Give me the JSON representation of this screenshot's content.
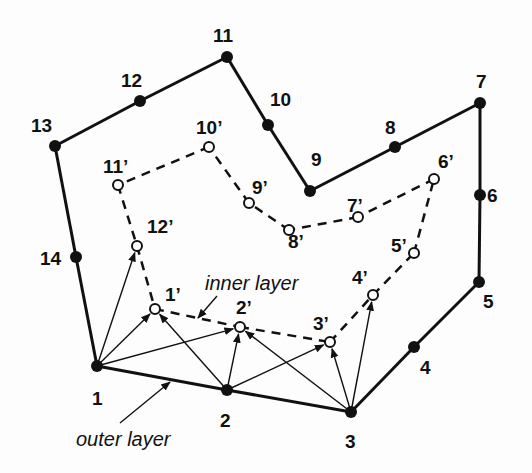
{
  "diagram": {
    "colors": {
      "ink": "#111111",
      "background": "#fdfdfd",
      "open_node_fill": "#ffffff"
    },
    "outer_layer": {
      "label": "outer layer",
      "style": "solid",
      "nodes": [
        {
          "id": "1",
          "label": "1",
          "x": 97,
          "y": 366,
          "lx": 92,
          "ly": 405
        },
        {
          "id": "2",
          "label": "2",
          "x": 227,
          "y": 390,
          "lx": 220,
          "ly": 427
        },
        {
          "id": "3",
          "label": "3",
          "x": 351,
          "y": 412,
          "lx": 345,
          "ly": 448
        },
        {
          "id": "4",
          "label": "4",
          "x": 414,
          "y": 347,
          "lx": 420,
          "ly": 374
        },
        {
          "id": "5",
          "label": "5",
          "x": 479,
          "y": 282,
          "lx": 483,
          "ly": 308
        },
        {
          "id": "6",
          "label": "6",
          "x": 480,
          "y": 195,
          "lx": 487,
          "ly": 202
        },
        {
          "id": "7",
          "label": "7",
          "x": 480,
          "y": 103,
          "lx": 476,
          "ly": 88
        },
        {
          "id": "8",
          "label": "8",
          "x": 395,
          "y": 147,
          "lx": 385,
          "ly": 134
        },
        {
          "id": "9",
          "label": "9",
          "x": 310,
          "y": 191,
          "lx": 311,
          "ly": 166
        },
        {
          "id": "10",
          "label": "10",
          "x": 268,
          "y": 125,
          "lx": 270,
          "ly": 106
        },
        {
          "id": "11",
          "label": "11",
          "x": 227,
          "y": 57,
          "lx": 213,
          "ly": 42
        },
        {
          "id": "12",
          "label": "12",
          "x": 140,
          "y": 101,
          "lx": 121,
          "ly": 87
        },
        {
          "id": "13",
          "label": "13",
          "x": 55,
          "y": 146,
          "lx": 31,
          "ly": 132
        },
        {
          "id": "14",
          "label": "14",
          "x": 76,
          "y": 257,
          "lx": 40,
          "ly": 265
        }
      ]
    },
    "inner_layer": {
      "label": "inner layer",
      "style": "dashed",
      "nodes": [
        {
          "id": "1p",
          "label": "1’",
          "x": 155,
          "y": 309,
          "lx": 165,
          "ly": 301
        },
        {
          "id": "2p",
          "label": "2’",
          "x": 240,
          "y": 327,
          "lx": 236,
          "ly": 314
        },
        {
          "id": "3p",
          "label": "3’",
          "x": 330,
          "y": 342,
          "lx": 313,
          "ly": 330
        },
        {
          "id": "4p",
          "label": "4’",
          "x": 373,
          "y": 295,
          "lx": 352,
          "ly": 284
        },
        {
          "id": "5p",
          "label": "5’",
          "x": 414,
          "y": 253,
          "lx": 391,
          "ly": 252
        },
        {
          "id": "6p",
          "label": "6’",
          "x": 434,
          "y": 179,
          "lx": 438,
          "ly": 168
        },
        {
          "id": "7p",
          "label": "7’",
          "x": 358,
          "y": 217,
          "lx": 347,
          "ly": 212
        },
        {
          "id": "8p",
          "label": "8’",
          "x": 289,
          "y": 230,
          "lx": 288,
          "ly": 248
        },
        {
          "id": "9p",
          "label": "9’",
          "x": 249,
          "y": 203,
          "lx": 252,
          "ly": 194
        },
        {
          "id": "10p",
          "label": "10’",
          "x": 209,
          "y": 147,
          "lx": 196,
          "ly": 134
        },
        {
          "id": "11p",
          "label": "11’",
          "x": 118,
          "y": 185,
          "lx": 103,
          "ly": 173
        },
        {
          "id": "12p",
          "label": "12’",
          "x": 137,
          "y": 246,
          "lx": 147,
          "ly": 233
        }
      ]
    },
    "connections": [
      {
        "from": "1",
        "to": "12p"
      },
      {
        "from": "1",
        "to": "1p"
      },
      {
        "from": "1",
        "to": "2p"
      },
      {
        "from": "2",
        "to": "1p"
      },
      {
        "from": "2",
        "to": "2p"
      },
      {
        "from": "2",
        "to": "3p"
      },
      {
        "from": "3",
        "to": "2p"
      },
      {
        "from": "3",
        "to": "3p"
      },
      {
        "from": "3",
        "to": "4p"
      }
    ],
    "annotations": [
      {
        "text": "inner layer",
        "x": 205,
        "y": 290,
        "pointer": {
          "x1": 217,
          "y1": 296,
          "x2": 198,
          "y2": 318
        }
      },
      {
        "text": "outer layer",
        "x": 76,
        "y": 446,
        "pointer": {
          "x1": 120,
          "y1": 423,
          "x2": 170,
          "y2": 382
        }
      }
    ]
  }
}
